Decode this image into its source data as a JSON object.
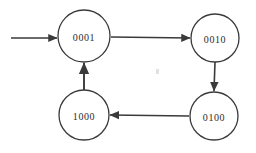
{
  "diagram": {
    "type": "state-transition-diagram",
    "background_color": "#ffffff",
    "stroke_color": "#3a3a3a",
    "text_color": "#2b2b2b",
    "stroke_width": 1.2,
    "node_radius": 25,
    "nodes": [
      {
        "id": "s0001",
        "label": "0001",
        "cx": 84,
        "cy": 36,
        "r": 26,
        "position": "top-left"
      },
      {
        "id": "s0010",
        "label": "0010",
        "cx": 215,
        "cy": 38,
        "r": 24,
        "position": "top-right"
      },
      {
        "id": "s0100",
        "label": "0100",
        "cx": 214,
        "cy": 116,
        "r": 24,
        "position": "bottom-right"
      },
      {
        "id": "s1000",
        "label": "1000",
        "cx": 84,
        "cy": 115,
        "r": 25,
        "position": "bottom-left"
      }
    ],
    "edges": [
      {
        "id": "e-entry",
        "from": "start",
        "to": "s0001",
        "direction": "right",
        "x1": 11,
        "y1": 38,
        "x2": 57,
        "y2": 38
      },
      {
        "id": "e-0001-0010",
        "from": "s0001",
        "to": "s0010",
        "direction": "right",
        "x1": 111,
        "y1": 37,
        "x2": 190,
        "y2": 38
      },
      {
        "id": "e-0010-0100",
        "from": "s0010",
        "to": "s0100",
        "direction": "down",
        "x1": 215,
        "y1": 62,
        "x2": 214,
        "y2": 91
      },
      {
        "id": "e-0100-1000",
        "from": "s0100",
        "to": "s1000",
        "direction": "left",
        "x1": 189,
        "y1": 116,
        "x2": 110,
        "y2": 115
      },
      {
        "id": "e-1000-0001",
        "from": "s1000",
        "to": "s0001",
        "direction": "up",
        "x1": 84,
        "y1": 90,
        "x2": 84,
        "y2": 63
      }
    ],
    "artifact": {
      "id": "scan-speck",
      "cx": 157,
      "cy": 71,
      "w": 3,
      "h": 5
    }
  }
}
